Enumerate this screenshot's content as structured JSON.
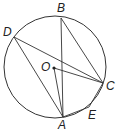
{
  "diagram": {
    "type": "circle-geometry",
    "circle": {
      "center": [
        55,
        67
      ],
      "r": 51
    },
    "points": {
      "A": {
        "label": "A",
        "x": 63,
        "y": 117,
        "lx": 58,
        "ly": 129
      },
      "B": {
        "label": "B",
        "x": 61,
        "y": 18,
        "lx": 57,
        "ly": 12
      },
      "C": {
        "label": "C",
        "x": 103,
        "y": 83,
        "lx": 106,
        "ly": 90
      },
      "D": {
        "label": "D",
        "x": 14,
        "y": 37,
        "lx": 3,
        "ly": 36
      },
      "E": {
        "label": "E",
        "x": 89,
        "y": 107,
        "lx": 88,
        "ly": 119
      },
      "O": {
        "label": "O",
        "x": 54,
        "y": 68,
        "lx": 41,
        "ly": 71
      }
    },
    "segments": [
      [
        "D",
        "A"
      ],
      [
        "D",
        "C"
      ],
      [
        "B",
        "A"
      ],
      [
        "B",
        "C"
      ],
      [
        "O",
        "A"
      ],
      [
        "O",
        "C"
      ],
      [
        "A",
        "E"
      ],
      [
        "E",
        "C"
      ]
    ]
  }
}
